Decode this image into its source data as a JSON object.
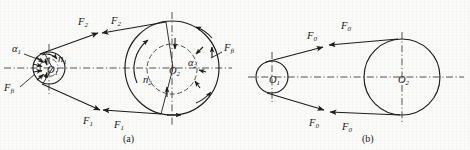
{
  "figure": {
    "background_color": "#fbfbfa",
    "line_color": "#1d1d1d",
    "panels": [
      {
        "caption": "(a)",
        "caption_x": 123,
        "caption_y": 140,
        "description": "Working state: driving and driven pulleys with wrap angles, rotation directions, friction forces and belt tensions",
        "pulleys": [
          {
            "name": "driving-pulley",
            "center_label": "O",
            "center_sub": "1",
            "cx": 49,
            "cy": 68,
            "r": 16,
            "inner_r": 9,
            "speed_label": "n",
            "speed_sub": "1",
            "speed_x": 58,
            "speed_y": 60,
            "angle_label": "α",
            "angle_sub": "1",
            "angle_x": 12,
            "angle_y": 52,
            "friction_label": "F",
            "friction_sub": "fi",
            "friction_x": 4,
            "friction_y": 89
          },
          {
            "name": "driven-pulley",
            "center_label": "O",
            "center_sub": "2",
            "cx": 172,
            "cy": 68,
            "r": 47,
            "inner_r": 25,
            "speed_label": "n",
            "speed_sub": "2",
            "speed_x": 143,
            "speed_y": 80,
            "angle_label": "α",
            "angle_sub": "2",
            "angle_x": 190,
            "angle_y": 65,
            "friction_label": "F",
            "friction_sub": "fi",
            "friction_x": 225,
            "friction_y": 52
          }
        ],
        "forces": [
          {
            "name": "tension-upper-left",
            "label": "F",
            "sub": "2",
            "x": 80,
            "y": 23
          },
          {
            "name": "tension-upper-right",
            "label": "F",
            "sub": "2",
            "x": 113,
            "y": 22
          },
          {
            "name": "tension-lower-left",
            "label": "F",
            "sub": "1",
            "x": 85,
            "y": 122
          },
          {
            "name": "tension-lower-right",
            "label": "F",
            "sub": "1",
            "x": 116,
            "y": 126
          }
        ]
      },
      {
        "caption": "(b)",
        "caption_x": 362,
        "caption_y": 140,
        "description": "Initial tension state: both belt sides carry equal initial tension F0",
        "pulleys": [
          {
            "name": "driving-pulley",
            "center_label": "O",
            "center_sub": "1",
            "cx": 272,
            "cy": 77,
            "r": 16,
            "speed_label": "",
            "speed_sub": ""
          },
          {
            "name": "driven-pulley",
            "center_label": "O",
            "center_sub": "2",
            "cx": 402,
            "cy": 77,
            "r": 38,
            "speed_label": "",
            "speed_sub": ""
          }
        ],
        "forces": [
          {
            "name": "initial-tension-upper-left",
            "label": "F",
            "sub": "0",
            "x": 309,
            "y": 37
          },
          {
            "name": "initial-tension-upper-right",
            "label": "F",
            "sub": "0",
            "x": 343,
            "y": 27
          },
          {
            "name": "initial-tension-lower-left",
            "label": "F",
            "sub": "0",
            "x": 311,
            "y": 124
          },
          {
            "name": "initial-tension-lower-right",
            "label": "F",
            "sub": "0",
            "x": 344,
            "y": 128
          }
        ]
      }
    ]
  }
}
